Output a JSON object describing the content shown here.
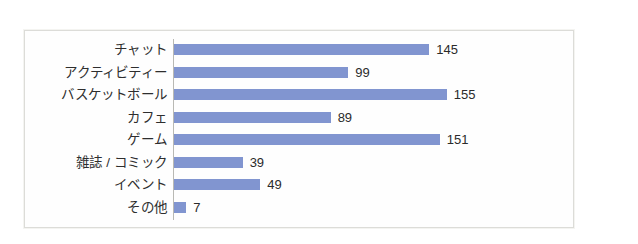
{
  "chart_data": {
    "type": "bar",
    "orientation": "horizontal",
    "title": "",
    "subtitle": "",
    "xlabel": "",
    "ylabel": "",
    "grid": false,
    "legend": false,
    "legend_position": "none",
    "axis_line": "category",
    "xlim": [
      0,
      155
    ],
    "bar_color": "#8195d0",
    "frame_color": "#dcdcd8",
    "background": "#ffffff",
    "data_labels": true,
    "categories": [
      "チャット",
      "アクティビティー",
      "バスケットボール",
      "カフェ",
      "ゲーム",
      "雑誌 / コミック",
      "イベント",
      "その他"
    ],
    "values": [
      145,
      99,
      155,
      89,
      151,
      39,
      49,
      7
    ],
    "value_labels": [
      "145",
      "99",
      "155",
      "89",
      "151",
      "39",
      "49",
      "7"
    ]
  }
}
